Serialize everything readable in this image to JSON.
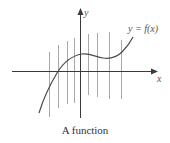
{
  "diagram": {
    "caption": "A function",
    "curve_label": "y = f(x)",
    "axes": {
      "x_label": "x",
      "y_label": "y"
    },
    "vertical_lines": [
      {
        "x": 49,
        "y1": 52,
        "y2": 117
      },
      {
        "x": 58,
        "y1": 45,
        "y2": 108
      },
      {
        "x": 67,
        "y1": 41,
        "y2": 104
      },
      {
        "x": 74,
        "y1": 38,
        "y2": 103
      },
      {
        "x": 88,
        "y1": 34,
        "y2": 95
      },
      {
        "x": 97,
        "y1": 33,
        "y2": 97
      },
      {
        "x": 109,
        "y1": 32,
        "y2": 99
      },
      {
        "x": 121,
        "y1": 40,
        "y2": 99
      }
    ],
    "colors": {
      "axis": "#3a3a3a",
      "curve": "#4a4a4a",
      "vertical_line": "#a8a8a8",
      "label": "#555555"
    }
  }
}
